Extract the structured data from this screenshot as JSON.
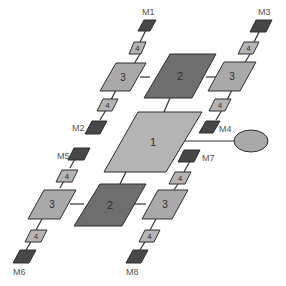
{
  "diagram": {
    "colors": {
      "light": "#b4b4b4",
      "medium": "#a9a9a9",
      "dark": "#6e6e6e",
      "darkest": "#474747",
      "stroke": "#2f2f2f",
      "line": "#333333",
      "background": "#ffffff"
    },
    "nodes": {
      "center": {
        "label": "1"
      },
      "top_hub": {
        "label": "2"
      },
      "bottom_hub": {
        "label": "2"
      },
      "tl_3": {
        "label": "3"
      },
      "tr_3": {
        "label": "3"
      },
      "bl_3": {
        "label": "3"
      },
      "br_3": {
        "label": "3"
      },
      "tl_4a": {
        "label": "4"
      },
      "tl_4b": {
        "label": "4"
      },
      "tr_4a": {
        "label": "4"
      },
      "tr_4b": {
        "label": "4"
      },
      "bl_4a": {
        "label": "4"
      },
      "bl_4b": {
        "label": "4"
      },
      "br_4a": {
        "label": "4"
      },
      "br_4b": {
        "label": "4"
      },
      "ellipse": {
        "label": ""
      }
    },
    "modules": {
      "m1": "M1",
      "m2": "M2",
      "m3": "M3",
      "m4": "M4",
      "m5": "M5",
      "m6": "M6",
      "m7": "M7",
      "m8": "M8"
    }
  }
}
